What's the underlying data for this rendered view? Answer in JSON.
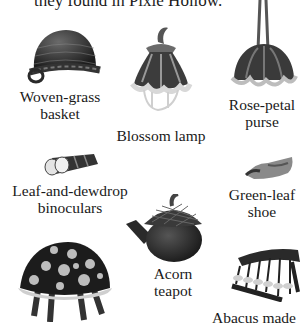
{
  "intro_text": "they found in Pixie Hollow.",
  "items": [
    {
      "id": "basket",
      "label_lines": [
        "Woven-grass",
        "basket"
      ],
      "icon": "basket-icon"
    },
    {
      "id": "lamp",
      "label_lines": [
        "Blossom lamp"
      ],
      "icon": "blossom-lamp-icon"
    },
    {
      "id": "purse",
      "label_lines": [
        "Rose-petal",
        "purse"
      ],
      "icon": "purse-icon"
    },
    {
      "id": "binoculars",
      "label_lines": [
        "Leaf-and-dewdrop",
        "binoculars"
      ],
      "icon": "binoculars-icon"
    },
    {
      "id": "shoe",
      "label_lines": [
        "Green-leaf",
        "shoe"
      ],
      "icon": "shoe-icon"
    },
    {
      "id": "teapot",
      "label_lines": [
        "Acorn",
        "teapot"
      ],
      "icon": "teapot-icon"
    },
    {
      "id": "mushroom",
      "label_lines": [],
      "icon": "mushroom-stool-icon"
    },
    {
      "id": "abacus",
      "label_lines": [
        "Abacus made"
      ],
      "icon": "abacus-icon"
    }
  ]
}
